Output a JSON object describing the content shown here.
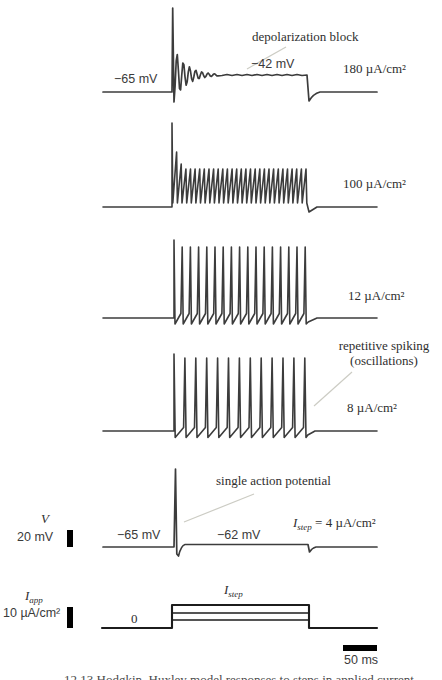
{
  "figure": {
    "caption": "12.13   Hodgkin–Huxley model responses to steps in applied current"
  },
  "annotations": {
    "depolarization_block": "depolarization block",
    "repetitive_spiking_line1": "repetitive spiking",
    "repetitive_spiking_line2": "(oscillations)",
    "single_action_potential": "single action potential"
  },
  "voltage_labels": {
    "trace1_baseline": "−65 mV",
    "trace1_plateau": "−42 mV",
    "trace5_baseline": "−65 mV",
    "trace5_plateau": "−62 mV"
  },
  "current_labels": {
    "trace1": "180 µA/cm²",
    "trace2": "100 µA/cm²",
    "trace3": "12 µA/cm²",
    "trace4": "8 µA/cm²",
    "trace5": {
      "sym": "I",
      "sub": "step",
      "rest": " = 4 µA/cm²"
    }
  },
  "axes": {
    "v_symbol": "V",
    "v_scale": "20 mV",
    "i_symbol": {
      "sym": "I",
      "sub": "app"
    },
    "i_scale": "10 µA/cm²",
    "i_zero": "0",
    "i_step": {
      "sym": "I",
      "sub": "step"
    },
    "time_scale": "50 ms"
  },
  "chart_data": {
    "type": "line",
    "xlabel": "time (scale bar 50 ms)",
    "ylabel": "V (scale bar 20 mV); I_app (scale bar 10 µA/cm²)",
    "grid": false,
    "legend_position": "right of each trace",
    "step_amplitudes_uA_per_cm2": [
      180,
      100,
      12,
      8,
      4
    ],
    "resting_potential_mV": -65,
    "series": [
      {
        "name": "V @ 180 µA/cm²",
        "behavior": "initial spike, damped oscillation, depolarization block",
        "baseline_mV": -65,
        "plateau_mV": -42,
        "n_spikes": 1
      },
      {
        "name": "V @ 100 µA/cm²",
        "behavior": "fast repetitive spiking",
        "baseline_mV": -65,
        "n_spikes": 30
      },
      {
        "name": "V @ 12 µA/cm²",
        "behavior": "repetitive spiking",
        "baseline_mV": -65,
        "n_spikes": 17
      },
      {
        "name": "V @ 8 µA/cm²",
        "behavior": "repetitive spiking (oscillations)",
        "baseline_mV": -65,
        "n_spikes": 13
      },
      {
        "name": "V @ 4 µA/cm²",
        "behavior": "single action potential then quasi-steady state",
        "baseline_mV": -65,
        "post_step_mV": -62,
        "n_spikes": 1
      },
      {
        "name": "I_app",
        "behavior": "step pulses",
        "baseline": 0,
        "levels_shown_uA_per_cm2": [
          4,
          8,
          12
        ]
      }
    ],
    "geometry": {
      "stroke_v": "#3c3c3c",
      "stroke_i": "#1c1c1c",
      "block": {
        "x0": 103,
        "xs": 172,
        "xe": 307,
        "xend": 377,
        "base": 92,
        "peak": 8,
        "plateau": 75,
        "amp": 27,
        "period": 6.2,
        "decay": 13,
        "under": 101
      },
      "train2": {
        "x0": 103,
        "xs": 172,
        "n": 30,
        "dx": 4.62,
        "peaks": [
          123,
          152,
          164,
          169
        ],
        "down": 0.8,
        "trough": 203,
        "ramp": null,
        "base": 207,
        "xe": 311,
        "xend": 377,
        "post": 212
      },
      "train3": {
        "x0": 103,
        "xs": 174,
        "n": 17,
        "dx": 8.2,
        "peaks": [
          240,
          247
        ],
        "down": 1.0,
        "trough": 324,
        "ramp": 313.5,
        "base": 318,
        "xe": 311,
        "xend": 377,
        "post": 322
      },
      "train4": {
        "x0": 103,
        "xs": 174,
        "n": 13,
        "dx": 10.9,
        "peaks": [
          354,
          358
        ],
        "down": 1.2,
        "trough": 437.5,
        "ramp": 427.5,
        "base": 431,
        "xe": 309,
        "xend": 377,
        "post": 435
      },
      "single": {
        "x0": 103,
        "xs": 174,
        "top": 469,
        "base": 547,
        "under": 556,
        "plateau": 544.5,
        "xe": 308,
        "dip": 552,
        "xend": 377
      },
      "current": {
        "x0": 102,
        "xs": 172,
        "xe": 309,
        "xend": 377,
        "base": 628,
        "levels": [
          620,
          613,
          605
        ]
      }
    }
  }
}
